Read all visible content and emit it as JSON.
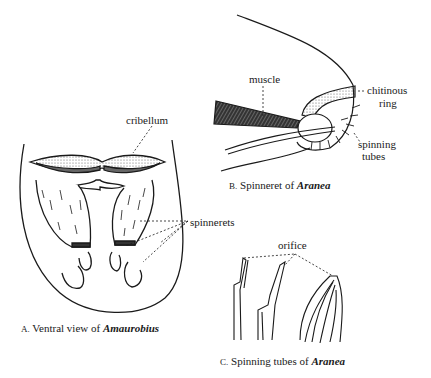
{
  "figure_a": {
    "caption_letter": "A.",
    "caption_text": "Ventral view of ",
    "caption_genus": "Amaurobius",
    "labels": {
      "cribellum": "cribellum",
      "spinnerets": "spinnerets"
    }
  },
  "figure_b": {
    "caption_letter": "B.",
    "caption_text": "Spinneret of ",
    "caption_genus": "Aranea",
    "labels": {
      "muscle": "muscle",
      "chitinous_ring_1": "chitinous",
      "chitinous_ring_2": "ring",
      "spinning_tubes_1": "spinning",
      "spinning_tubes_2": "tubes"
    }
  },
  "figure_c": {
    "caption_letter": "C.",
    "caption_text": "Spinning tubes of ",
    "caption_genus": "Aranea",
    "labels": {
      "orifice": "orifice"
    }
  }
}
